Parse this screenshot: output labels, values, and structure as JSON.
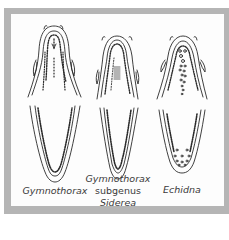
{
  "figure": {
    "type": "diagram",
    "frame_color": "#b5b5b5",
    "panel_color": "#fdfdfd",
    "line_color": "#2a2a2a"
  },
  "specimens": [
    {
      "id": "gymnothorax",
      "label_lines": [
        "Gymnothorax"
      ],
      "label_styles": [
        "italic"
      ],
      "views": [
        "upper-jaw",
        "lower-jaw"
      ]
    },
    {
      "id": "siderea",
      "label_lines": [
        "Gymnothorax",
        "subgenus",
        "Siderea"
      ],
      "label_styles": [
        "italic",
        "upright",
        "italic"
      ],
      "views": [
        "upper-jaw",
        "lower-jaw"
      ]
    },
    {
      "id": "echidna",
      "label_lines": [
        "Echidna"
      ],
      "label_styles": [
        "italic"
      ],
      "views": [
        "upper-jaw",
        "lower-jaw"
      ]
    }
  ]
}
